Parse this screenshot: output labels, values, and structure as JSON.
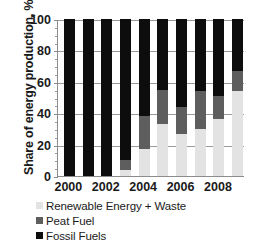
{
  "chart_data": {
    "type": "bar",
    "subtype": "stacked-bar-100-percent",
    "title": "",
    "xlabel": "",
    "ylabel": "Share of energy production, %",
    "ylim": [
      0,
      100
    ],
    "yticks": [
      0,
      20,
      40,
      60,
      80,
      100
    ],
    "ytick_labels": [
      "0",
      "20",
      "40",
      "60",
      "80",
      "100"
    ],
    "grid": true,
    "grid_axis": "y",
    "legend_position": "below-plot-left",
    "categories": [
      "2000",
      "2001",
      "2002",
      "2003",
      "2004",
      "2005",
      "2006",
      "2007",
      "2008",
      "2009"
    ],
    "xtick_labels_shown": [
      "2000",
      "2002",
      "2004",
      "2006",
      "2008"
    ],
    "stack_order_bottom_to_top": [
      "Renewable Energy + Waste",
      "Peat Fuel",
      "Fossil Fuels"
    ],
    "series": [
      {
        "name": "Renewable Energy + Waste",
        "color": "#e3e3e3",
        "values": [
          0,
          0,
          0,
          4,
          17,
          33,
          27,
          30,
          36,
          54
        ]
      },
      {
        "name": "Peat Fuel",
        "color": "#5e5e5e",
        "values": [
          0,
          0,
          0,
          6,
          21,
          22,
          17,
          24,
          15,
          13
        ]
      },
      {
        "name": "Fossil Fuels",
        "color": "#0d0d0d",
        "values": [
          100,
          100,
          100,
          90,
          62,
          45,
          56,
          46,
          49,
          33
        ]
      }
    ]
  },
  "axes": {
    "y_title": "Share of energy production, %",
    "y_tick_labels": [
      "100",
      "80",
      "60",
      "40",
      "20",
      "0"
    ],
    "x_tick_labels": [
      "2000",
      "2002",
      "2004",
      "2006",
      "2008"
    ]
  },
  "legend": {
    "items": [
      {
        "label": "Renewable Energy + Waste",
        "color": "#e3e3e3"
      },
      {
        "label": "Peat Fuel",
        "color": "#5e5e5e"
      },
      {
        "label": "Fossil Fuels",
        "color": "#0d0d0d"
      }
    ]
  }
}
